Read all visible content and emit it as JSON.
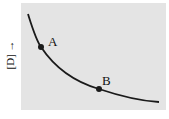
{
  "diagram": {
    "y_axis_label": "[D] →",
    "curve": "decreasing concave-up curve",
    "points": [
      {
        "label": "A",
        "x": 41,
        "y": 47
      },
      {
        "label": "B",
        "x": 99,
        "y": 89
      }
    ],
    "colors": {
      "background": "#e4e4e4",
      "curve": "#1a1a1a"
    }
  }
}
